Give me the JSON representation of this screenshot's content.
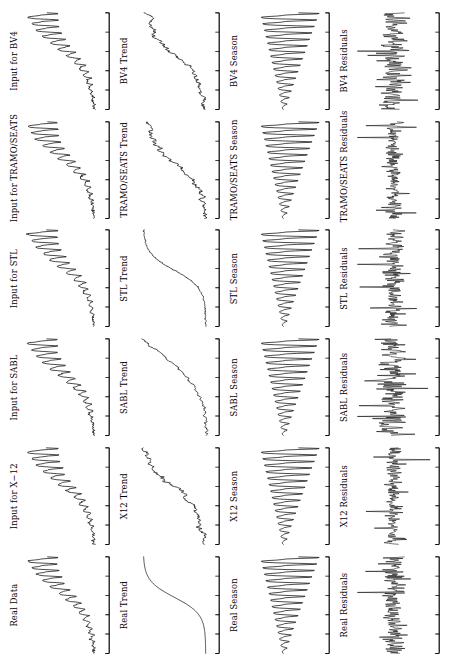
{
  "figure": {
    "title": "",
    "orientation": "rotated-90",
    "rows": 4,
    "columns": 6,
    "line_color": "#000000",
    "background_color": "#ffffff",
    "axis_color": "#000000"
  },
  "row_labels": [
    "Input",
    "Trend",
    "Season",
    "Residuals"
  ],
  "column_methods": [
    "Real",
    "X-12",
    "SABL",
    "STL",
    "TRAMO/SEATS",
    "BV4"
  ],
  "panels": [
    {
      "label": "Real Data",
      "row": 0,
      "col": 0,
      "kind": "input"
    },
    {
      "label": "Input for X−12",
      "row": 0,
      "col": 1,
      "kind": "input"
    },
    {
      "label": "Input for SABL",
      "row": 0,
      "col": 2,
      "kind": "input"
    },
    {
      "label": "Input for STL",
      "row": 0,
      "col": 3,
      "kind": "input"
    },
    {
      "label": "Input for TRAMO/SEATS",
      "row": 0,
      "col": 4,
      "kind": "input"
    },
    {
      "label": "Input for BV4",
      "row": 0,
      "col": 5,
      "kind": "input"
    },
    {
      "label": "Real Trend",
      "row": 1,
      "col": 0,
      "kind": "trend_smooth"
    },
    {
      "label": "X12 Trend",
      "row": 1,
      "col": 1,
      "kind": "trend_rough"
    },
    {
      "label": "SABL Trend",
      "row": 1,
      "col": 2,
      "kind": "trend_sabl"
    },
    {
      "label": "STL Trend",
      "row": 1,
      "col": 3,
      "kind": "trend_smooth2"
    },
    {
      "label": "TRAMO/SEATS Trend",
      "row": 1,
      "col": 4,
      "kind": "trend_rough"
    },
    {
      "label": "BV4 Trend",
      "row": 1,
      "col": 5,
      "kind": "trend_rough"
    },
    {
      "label": "Real Season",
      "row": 2,
      "col": 0,
      "kind": "season"
    },
    {
      "label": "X12 Season",
      "row": 2,
      "col": 1,
      "kind": "season"
    },
    {
      "label": "SABL Season",
      "row": 2,
      "col": 2,
      "kind": "season"
    },
    {
      "label": "STL Season",
      "row": 2,
      "col": 3,
      "kind": "season"
    },
    {
      "label": "TRAMO/SEATS Season",
      "row": 2,
      "col": 4,
      "kind": "season"
    },
    {
      "label": "BV4 Season",
      "row": 2,
      "col": 5,
      "kind": "season"
    },
    {
      "label": "Real Residuals",
      "row": 3,
      "col": 0,
      "kind": "residuals"
    },
    {
      "label": "X12 Residuals",
      "row": 3,
      "col": 1,
      "kind": "residuals"
    },
    {
      "label": "SABL Residuals",
      "row": 3,
      "col": 2,
      "kind": "residuals"
    },
    {
      "label": "STL Residuals",
      "row": 3,
      "col": 3,
      "kind": "residuals"
    },
    {
      "label": "TRAMO/SEATS Residuals",
      "row": 3,
      "col": 4,
      "kind": "residuals"
    },
    {
      "label": "BV4 Residuals",
      "row": 3,
      "col": 5,
      "kind": "residuals"
    }
  ],
  "chart_data": {
    "type": "line",
    "title": "",
    "xlabel": "",
    "ylabel": "",
    "grid": false,
    "legend": "none",
    "n_points": 180,
    "axis": {
      "n_ticks": 6,
      "tick_labels": [
        "",
        "",
        "",
        "",
        "",
        ""
      ],
      "xlim": [
        0,
        180
      ],
      "tick_side": "bottom"
    },
    "series_specs": {
      "input": {
        "description": "Multiplicative seasonal series with exponentially growing level and growing seasonal amplitude",
        "trend": {
          "form": "logistic_exponential",
          "start": 0.06,
          "end": 0.95
        },
        "season": {
          "period": 12,
          "amp_start": 0.015,
          "amp_end": 0.42
        },
        "noise_sd": 0.012,
        "ylim": [
          0,
          1
        ]
      },
      "trend_smooth": {
        "description": "Smooth monotone S-shaped trend (true trend)",
        "form": "logistic",
        "ylim": [
          0,
          1
        ],
        "noise_sd": 0.0
      },
      "trend_smooth2": {
        "description": "Smooth monotone S-shaped trend, STL estimate",
        "form": "logistic",
        "ylim": [
          0,
          1
        ],
        "noise_sd": 0.006
      },
      "trend_rough": {
        "description": "Estimated trend with small local wiggles",
        "form": "logistic",
        "ylim": [
          0,
          1
        ],
        "noise_sd": 0.018
      },
      "trend_sabl": {
        "description": "SABL trend, flatter early then steep rise",
        "form": "convex_logistic",
        "ylim": [
          0,
          1
        ],
        "noise_sd": 0.016
      },
      "season": {
        "description": "Seasonal component, amplitude grows over time (funnel shape)",
        "period": 12,
        "amp_start": 0.05,
        "amp_end": 1.0,
        "ylim": [
          -1,
          1
        ]
      },
      "residuals": {
        "description": "Irregular / residual component, high-frequency noise about zero with occasional spikes",
        "noise_sd": 0.22,
        "spike_prob": 0.07,
        "spike_scale": 3.4,
        "ylim": [
          -1,
          1
        ]
      }
    }
  }
}
